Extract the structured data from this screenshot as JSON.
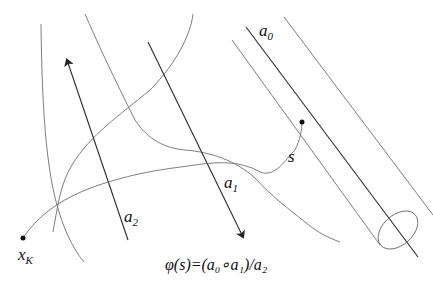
{
  "labels": {
    "a0": "a",
    "a0_sub": "0",
    "a1": "a",
    "a1_sub": "1",
    "a2": "a",
    "a2_sub": "2",
    "s": "s",
    "xK": "x",
    "xK_sub": "K",
    "formula": "φ(s)=(a₀∘a₁)/a₂"
  },
  "colors": {
    "background": "#ffffff",
    "curve": "#6f6f6f",
    "arrow": "#2a2a2a"
  }
}
